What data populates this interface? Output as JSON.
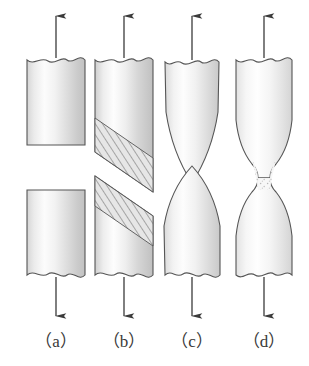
{
  "figure": {
    "background_color": "#ffffff",
    "outline_color": "#4a4a4a",
    "arrow_color": "#3b3b3b",
    "label_color": "#3a3a3a",
    "fill_light": "#fdfdfd",
    "fill_mid": "#e8e8e8",
    "fill_dark": "#bcbcbc",
    "panel_count": 4
  },
  "panels": [
    {
      "id": "a",
      "label": "（a）",
      "label_text": "(a)",
      "center_x": 56,
      "fracture_type": "flat-transverse",
      "description": "straight flat brittle fracture, cylinder split square across",
      "top_arrow": "up-arrow",
      "bottom_arrow": "down-arrow",
      "has_hatching": false,
      "has_neck": false
    },
    {
      "id": "b",
      "label": "（b）",
      "label_text": "(b)",
      "center_x": 124,
      "fracture_type": "inclined-shear",
      "description": "45 degree slant shear fracture with hatched shear plane",
      "top_arrow": "up-arrow",
      "bottom_arrow": "down-arrow",
      "has_hatching": true,
      "has_neck": false
    },
    {
      "id": "c",
      "label": "（c）",
      "label_text": "(c)",
      "center_x": 192,
      "fracture_type": "cup-and-cone",
      "description": "conical cup and cone fracture, tapered point",
      "top_arrow": "up-arrow",
      "bottom_arrow": "down-arrow",
      "has_hatching": false,
      "has_neck": false
    },
    {
      "id": "d",
      "label": "（d）",
      "label_text": "(d)",
      "center_x": 264,
      "fracture_type": "ductile-necking",
      "description": "ductile specimen with pronounced neck and stippled waist",
      "top_arrow": "up-arrow",
      "bottom_arrow": "down-arrow",
      "has_hatching": false,
      "has_neck": true
    }
  ],
  "labels_row": {
    "y": 341,
    "items": [
      "（a）",
      "（b）",
      "（c）",
      "（d）"
    ]
  }
}
